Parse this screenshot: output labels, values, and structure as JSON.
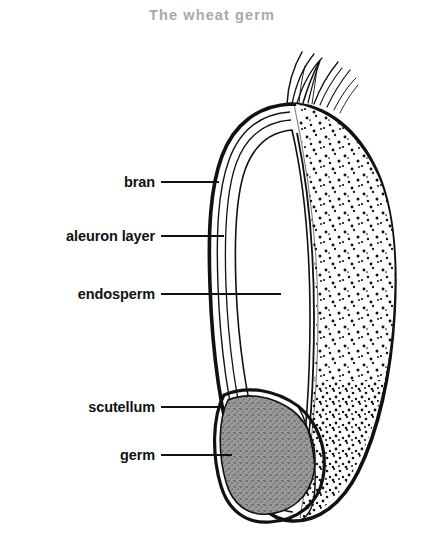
{
  "figure": {
    "title": "The wheat germ",
    "title_color": "#a9a9a9",
    "background_color": "#ffffff",
    "ink_color": "#111111",
    "germ_fill_color": "#8a8a8a"
  },
  "labels": [
    {
      "id": "bran",
      "text": "bran",
      "x": 155,
      "y": 182,
      "leader_end_x": 219
    },
    {
      "id": "aleuron-layer",
      "text": "aleuron layer",
      "x": 155,
      "y": 236,
      "leader_end_x": 224
    },
    {
      "id": "endosperm",
      "text": "endosperm",
      "x": 155,
      "y": 294,
      "leader_end_x": 281
    },
    {
      "id": "scutellum",
      "text": "scutellum",
      "x": 155,
      "y": 407,
      "leader_end_x": 222
    },
    {
      "id": "germ",
      "text": "germ",
      "x": 155,
      "y": 455,
      "leader_end_x": 232
    }
  ],
  "diagram_parts": [
    {
      "id": "brush-hairs",
      "name": "brush hairs"
    },
    {
      "id": "pericarp-bran",
      "name": "bran / pericarp outer wall"
    },
    {
      "id": "aleuron-band",
      "name": "aleuron layer band"
    },
    {
      "id": "endosperm-left",
      "name": "endosperm inner cavity"
    },
    {
      "id": "endosperm-right",
      "name": "starchy endosperm stipple"
    },
    {
      "id": "scutellum-shape",
      "name": "scutellum"
    },
    {
      "id": "germ-shape",
      "name": "germ / embryo"
    }
  ]
}
